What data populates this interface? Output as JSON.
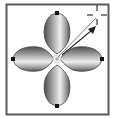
{
  "illustration": {
    "subject": "four-petal-shape-with-rotate-handle",
    "frame": {
      "x": 6,
      "y": 4,
      "width": 103,
      "height": 111,
      "stroke": "#5a5a5a",
      "fill": "#ffffff"
    },
    "center": {
      "x": 57,
      "y": 59
    },
    "petals": [
      {
        "name": "top",
        "rotate": 0
      },
      {
        "name": "right",
        "rotate": 90
      },
      {
        "name": "bottom",
        "rotate": 180
      },
      {
        "name": "left",
        "rotate": 270
      }
    ],
    "colors": {
      "petal_dark": "#5c5c5c",
      "petal_mid": "#9a9a9a",
      "petal_light": "#e6e6e6",
      "outline": "#3a3a3a",
      "anchor": "#111111",
      "arrow": "#2a2a2a",
      "crosshair": "#333333"
    },
    "arrow": {
      "from": [
        60,
        56
      ],
      "to": [
        94,
        28
      ]
    },
    "crosshair": {
      "x": 97,
      "y": 15
    }
  }
}
